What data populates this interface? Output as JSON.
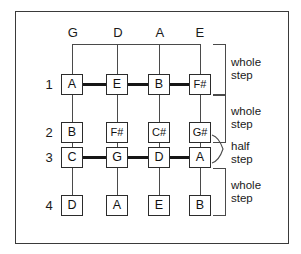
{
  "figure": {
    "border_color": "#3a3a3a",
    "background": "#ffffff"
  },
  "columns": {
    "header_label": "string",
    "headers": [
      "G",
      "D",
      "A",
      "E"
    ],
    "x_positions": [
      73,
      118,
      160,
      200
    ]
  },
  "rows": {
    "numbers": [
      "1",
      "2",
      "3",
      "4"
    ],
    "y_positions": [
      85,
      133,
      158,
      206
    ]
  },
  "grid": [
    {
      "row": "1",
      "notes": [
        "A",
        "E",
        "B",
        "F#"
      ],
      "bold_connection": true
    },
    {
      "row": "2",
      "notes": [
        "B",
        "F#",
        "C#",
        "G#"
      ],
      "bold_connection": false
    },
    {
      "row": "3",
      "notes": [
        "C",
        "G",
        "D",
        "A"
      ],
      "bold_connection": true
    },
    {
      "row": "4",
      "notes": [
        "D",
        "A",
        "E",
        "B"
      ],
      "bold_connection": false
    }
  ],
  "annotations": [
    {
      "id": "ws1",
      "label": "whole\nstep",
      "type": "bracket"
    },
    {
      "id": "ws2",
      "label": "whole\nstep",
      "type": "bracket"
    },
    {
      "id": "hs1",
      "label": "half\nstep",
      "type": "brace"
    },
    {
      "id": "ws3",
      "label": "whole\nstep",
      "type": "bracket"
    }
  ],
  "colors": {
    "line": "#4a4a4a",
    "bold_line": "#161616",
    "box_border": "#2b2b2b",
    "text": "#111111"
  }
}
